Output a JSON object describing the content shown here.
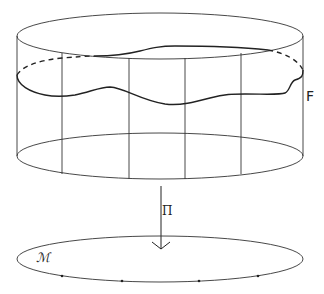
{
  "diagram": {
    "labels": {
      "fiber_space": "F",
      "projection": "Π",
      "base_manifold": "ℳ"
    },
    "colors": {
      "stroke": "#333333",
      "background": "#ffffff"
    },
    "elements": {
      "cylinder": "total space drawn as cylinder with vertical fibers",
      "section_curve": "wavy closed curve around cylinder (front solid, back partly dashed)",
      "arrow": "downward projection arrow labeled Π",
      "base": "ellipse labeled ℳ with four marked points"
    },
    "fiber_count": 4,
    "marked_points": 4
  }
}
